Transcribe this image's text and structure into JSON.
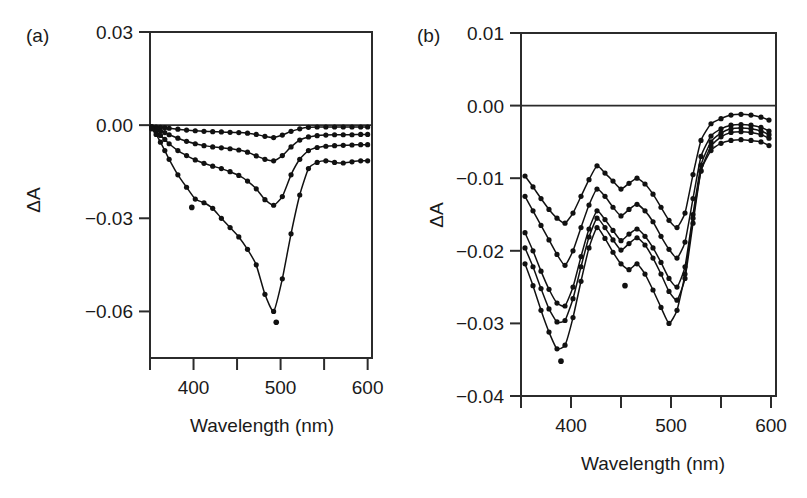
{
  "figure": {
    "background_color": "#ffffff",
    "ink_color": "#111111"
  },
  "panel_a": {
    "label": "(a)",
    "y_axis_title": "ΔA",
    "x_axis_title": "Wavelength (nm)",
    "y_ticks": [
      "0.03",
      "0.00",
      "−0.03",
      "−0.06"
    ],
    "x_ticks": [
      "400",
      "500",
      "600"
    ]
  },
  "panel_b": {
    "label": "(b)",
    "y_axis_title": "ΔA",
    "x_axis_title": "Wavelength (nm)",
    "y_ticks": [
      "0.01",
      "0.00",
      "−0.01",
      "−0.02",
      "−0.03",
      "−0.04"
    ],
    "x_ticks": [
      "400",
      "500",
      "600"
    ]
  },
  "chart_data": [
    {
      "id": "panel_a",
      "type": "line",
      "title": "(a)",
      "xlabel": "Wavelength (nm)",
      "ylabel": "ΔA",
      "xlim": [
        350,
        605
      ],
      "ylim": [
        -0.075,
        0.03
      ],
      "x_major_ticks": [
        400,
        500,
        600
      ],
      "x_minor_ticks": [
        350,
        450,
        550
      ],
      "y_major_ticks": [
        0.03,
        0.0,
        -0.03,
        -0.06
      ],
      "grid": false,
      "legend": "none",
      "zero_line": true,
      "marker": "filled-circle",
      "series": [
        {
          "name": "trace-1",
          "x": [
            352,
            357,
            362,
            367,
            372,
            382,
            392,
            402,
            412,
            422,
            432,
            442,
            452,
            462,
            472,
            482,
            492,
            502,
            512,
            522,
            532,
            542,
            552,
            562,
            572,
            582,
            592,
            600
          ],
          "values": [
            -0.0005,
            -0.0006,
            -0.0007,
            -0.0008,
            -0.001,
            -0.0013,
            -0.0016,
            -0.0018,
            -0.002,
            -0.0021,
            -0.0022,
            -0.0023,
            -0.0024,
            -0.0026,
            -0.003,
            -0.0036,
            -0.004,
            -0.0032,
            -0.002,
            -0.0012,
            -0.0007,
            -0.0006,
            -0.0006,
            -0.0006,
            -0.0006,
            -0.0006,
            -0.0006,
            -0.0006
          ]
        },
        {
          "name": "trace-2",
          "x": [
            352,
            357,
            362,
            367,
            372,
            382,
            392,
            402,
            412,
            422,
            432,
            442,
            452,
            462,
            472,
            482,
            492,
            502,
            512,
            522,
            532,
            542,
            552,
            562,
            572,
            582,
            592,
            600
          ],
          "values": [
            -0.0008,
            -0.0012,
            -0.0018,
            -0.0024,
            -0.0031,
            -0.0042,
            -0.0052,
            -0.006,
            -0.0066,
            -0.007,
            -0.0073,
            -0.0076,
            -0.008,
            -0.0087,
            -0.0099,
            -0.011,
            -0.0115,
            -0.0098,
            -0.007,
            -0.0048,
            -0.0038,
            -0.0034,
            -0.0032,
            -0.0031,
            -0.0031,
            -0.0031,
            -0.003,
            -0.003
          ]
        },
        {
          "name": "trace-3",
          "x": [
            352,
            357,
            362,
            367,
            372,
            382,
            392,
            402,
            412,
            422,
            432,
            442,
            452,
            462,
            472,
            482,
            492,
            502,
            512,
            522,
            532,
            542,
            552,
            562,
            572,
            582,
            592,
            600
          ],
          "values": [
            -0.001,
            -0.002,
            -0.0033,
            -0.0046,
            -0.006,
            -0.0082,
            -0.0098,
            -0.0112,
            -0.0123,
            -0.0132,
            -0.014,
            -0.015,
            -0.0162,
            -0.018,
            -0.0205,
            -0.024,
            -0.0258,
            -0.023,
            -0.016,
            -0.011,
            -0.0082,
            -0.0072,
            -0.0068,
            -0.0066,
            -0.0065,
            -0.0064,
            -0.0063,
            -0.0063
          ]
        },
        {
          "name": "trace-4",
          "x": [
            352,
            357,
            362,
            367,
            372,
            382,
            392,
            402,
            412,
            422,
            432,
            442,
            452,
            462,
            472,
            482,
            492,
            502,
            512,
            522,
            532,
            542,
            552,
            562,
            572,
            582,
            592,
            600
          ],
          "values": [
            -0.0012,
            -0.003,
            -0.0055,
            -0.0082,
            -0.011,
            -0.016,
            -0.02,
            -0.0238,
            -0.025,
            -0.0268,
            -0.03,
            -0.033,
            -0.036,
            -0.04,
            -0.045,
            -0.0545,
            -0.06,
            -0.0495,
            -0.035,
            -0.0225,
            -0.014,
            -0.012,
            -0.0115,
            -0.012,
            -0.0122,
            -0.0118,
            -0.0115,
            -0.0115
          ]
        }
      ],
      "outlier_points": [
        {
          "x": 398,
          "y": -0.0265
        },
        {
          "x": 495,
          "y": -0.0635
        }
      ]
    },
    {
      "id": "panel_b",
      "type": "line",
      "title": "(b)",
      "xlabel": "Wavelength (nm)",
      "ylabel": "ΔA",
      "xlim": [
        350,
        605
      ],
      "ylim": [
        -0.04,
        0.01
      ],
      "x_major_ticks": [
        400,
        500,
        600
      ],
      "x_minor_ticks": [
        350,
        450,
        550
      ],
      "y_major_ticks": [
        0.01,
        0.0,
        -0.01,
        -0.02,
        -0.03,
        -0.04
      ],
      "grid": false,
      "legend": "none",
      "zero_line": true,
      "marker": "filled-circle",
      "series": [
        {
          "name": "trace-1",
          "x": [
            354,
            362,
            370,
            378,
            386,
            394,
            402,
            410,
            418,
            426,
            434,
            442,
            450,
            458,
            466,
            474,
            482,
            490,
            498,
            506,
            514,
            522,
            530,
            540,
            550,
            560,
            570,
            580,
            590,
            598
          ],
          "values": [
            -0.0097,
            -0.0112,
            -0.0128,
            -0.0143,
            -0.0155,
            -0.0162,
            -0.0148,
            -0.0125,
            -0.0102,
            -0.0083,
            -0.0093,
            -0.0104,
            -0.0115,
            -0.0107,
            -0.01,
            -0.0108,
            -0.0122,
            -0.014,
            -0.0158,
            -0.0168,
            -0.0148,
            -0.0095,
            -0.0048,
            -0.0025,
            -0.0018,
            -0.0013,
            -0.0012,
            -0.0013,
            -0.0016,
            -0.002
          ]
        },
        {
          "name": "trace-2",
          "x": [
            354,
            362,
            370,
            378,
            386,
            394,
            402,
            410,
            418,
            426,
            434,
            442,
            450,
            458,
            466,
            474,
            482,
            490,
            498,
            506,
            514,
            522,
            530,
            540,
            550,
            560,
            570,
            580,
            590,
            598
          ],
          "values": [
            -0.0125,
            -0.0145,
            -0.0165,
            -0.0185,
            -0.0205,
            -0.022,
            -0.02,
            -0.0168,
            -0.0137,
            -0.0115,
            -0.0125,
            -0.014,
            -0.0152,
            -0.0143,
            -0.0136,
            -0.0145,
            -0.016,
            -0.018,
            -0.0198,
            -0.021,
            -0.0188,
            -0.0128,
            -0.007,
            -0.0042,
            -0.0032,
            -0.0027,
            -0.0026,
            -0.0027,
            -0.003,
            -0.0035
          ]
        },
        {
          "name": "trace-3",
          "x": [
            354,
            362,
            370,
            378,
            386,
            394,
            402,
            410,
            418,
            426,
            434,
            442,
            450,
            458,
            466,
            474,
            482,
            490,
            498,
            506,
            514,
            522,
            530,
            540,
            550,
            560,
            570,
            580,
            590,
            598
          ],
          "values": [
            -0.0175,
            -0.02,
            -0.0228,
            -0.0253,
            -0.0272,
            -0.0276,
            -0.025,
            -0.0208,
            -0.017,
            -0.0145,
            -0.0157,
            -0.0172,
            -0.0186,
            -0.0177,
            -0.017,
            -0.018,
            -0.0196,
            -0.0216,
            -0.0238,
            -0.025,
            -0.0222,
            -0.015,
            -0.0082,
            -0.005,
            -0.0038,
            -0.0032,
            -0.0031,
            -0.0032,
            -0.0035,
            -0.004
          ]
        },
        {
          "name": "trace-4",
          "x": [
            354,
            362,
            370,
            378,
            386,
            394,
            402,
            410,
            418,
            426,
            434,
            442,
            450,
            458,
            466,
            474,
            482,
            490,
            498,
            506,
            514,
            522,
            530,
            540,
            550,
            560,
            570,
            580,
            590,
            598
          ],
          "values": [
            -0.0196,
            -0.0222,
            -0.0252,
            -0.028,
            -0.0298,
            -0.0296,
            -0.0266,
            -0.0222,
            -0.0181,
            -0.0155,
            -0.0168,
            -0.0185,
            -0.0199,
            -0.019,
            -0.0182,
            -0.0192,
            -0.021,
            -0.0232,
            -0.0256,
            -0.0268,
            -0.0238,
            -0.0162,
            -0.009,
            -0.0056,
            -0.0043,
            -0.0037,
            -0.0036,
            -0.0037,
            -0.004,
            -0.0045
          ]
        },
        {
          "name": "trace-5",
          "x": [
            354,
            362,
            370,
            378,
            386,
            394,
            402,
            410,
            418,
            426,
            434,
            442,
            450,
            458,
            466,
            474,
            482,
            490,
            498,
            506,
            514,
            522,
            530,
            540,
            550,
            560,
            570,
            580,
            590,
            598
          ],
          "values": [
            -0.0218,
            -0.0248,
            -0.0282,
            -0.0312,
            -0.0335,
            -0.033,
            -0.0292,
            -0.0242,
            -0.0196,
            -0.0168,
            -0.0183,
            -0.0202,
            -0.0218,
            -0.0226,
            -0.0218,
            -0.0232,
            -0.0254,
            -0.0278,
            -0.03,
            -0.0282,
            -0.0232,
            -0.0155,
            -0.009,
            -0.0062,
            -0.0052,
            -0.0048,
            -0.0047,
            -0.0048,
            -0.005,
            -0.0055
          ]
        }
      ],
      "outlier_points": [
        {
          "x": 390,
          "y": -0.0352
        },
        {
          "x": 454,
          "y": -0.0248
        }
      ]
    }
  ]
}
